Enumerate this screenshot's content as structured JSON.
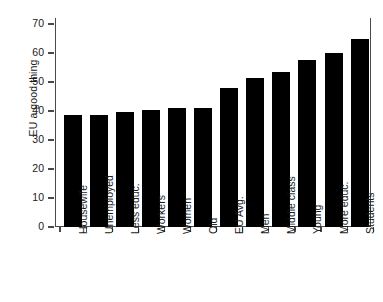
{
  "chart_data": {
    "type": "bar",
    "title": "",
    "xlabel": "",
    "ylabel": "EU a good thing",
    "ylim": [
      0,
      70
    ],
    "yticks": [
      0,
      10,
      20,
      30,
      40,
      50,
      60,
      70
    ],
    "grid": false,
    "legend": false,
    "categories": [
      "Housewife",
      "Unemployed",
      "Less educ.",
      "Workers",
      "Women",
      "Old",
      "EU Avg.",
      "Men",
      "Middle class",
      "Young",
      "More educ.",
      "Students"
    ],
    "values": [
      38.5,
      38.5,
      39.5,
      40.5,
      41,
      41,
      48,
      51.5,
      53.5,
      57.5,
      60,
      65
    ],
    "bar_color": "#000000",
    "axis_color": "#4a4a4a"
  }
}
